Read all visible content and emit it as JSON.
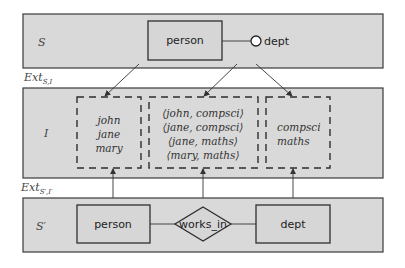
{
  "diagram": {
    "top_panel": {
      "label": "S",
      "entity": "person",
      "attribute": "dept"
    },
    "ext_top": {
      "base": "Ext",
      "subscript": "S,I"
    },
    "instance_panel": {
      "label": "I",
      "person_values": [
        "john",
        "jane",
        "mary"
      ],
      "pair_values": [
        "⟨john, compsci⟩",
        "⟨jane, compsci⟩",
        "⟨jane, maths⟩",
        "⟨mary, maths⟩"
      ],
      "dept_values": [
        "compsci",
        "maths"
      ]
    },
    "ext_bottom": {
      "base": "Ext",
      "subscript": "S′,I′"
    },
    "bottom_panel": {
      "label": "S′",
      "entity_left": "person",
      "relationship": "works_in",
      "entity_right": "dept"
    },
    "colors": {
      "panel_fill": "#d9d9d9",
      "stroke": "#2e2e2e"
    }
  }
}
